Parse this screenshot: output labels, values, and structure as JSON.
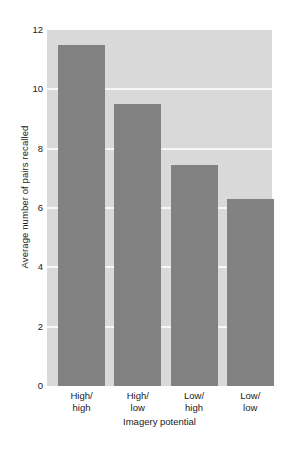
{
  "chart_data": {
    "type": "bar",
    "title": "",
    "categories": [
      "High/\nhigh",
      "High/\nlow",
      "Low/\nhigh",
      "Low/\nlow"
    ],
    "category_lines": [
      [
        "High/",
        "high"
      ],
      [
        "High/",
        "low"
      ],
      [
        "Low/",
        "high"
      ],
      [
        "Low/",
        "low"
      ]
    ],
    "values": [
      11.5,
      9.5,
      7.45,
      6.3
    ],
    "xlabel": "Imagery potential",
    "ylabel": "Average number of pairs recalled",
    "ylim": [
      0,
      12
    ],
    "ytick_labels": [
      "0",
      "2",
      "4",
      "6",
      "8",
      "10",
      "12"
    ],
    "ytick_values": [
      0,
      2,
      4,
      6,
      8,
      10,
      12
    ],
    "grid": true,
    "grid_axis": "y",
    "legend": false,
    "legend_position": "none",
    "colors": {
      "bar": "#818181",
      "plot_background": "#d9d9d9",
      "gridline": "#f7f7f7",
      "figure_background": "#ffffff",
      "text": "#1a1a1a"
    }
  }
}
